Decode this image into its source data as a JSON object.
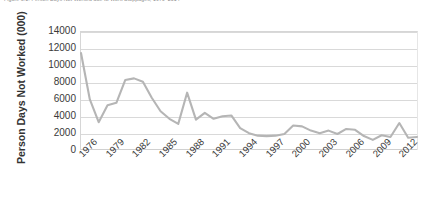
{
  "figure": {
    "caption": "Figure 3.1: Person Days Not Worked due to Work Stoppages, 1976–2014"
  },
  "chart_data": {
    "type": "line",
    "title": "",
    "subtitle": "",
    "xlabel": "",
    "ylabel": "Person Days Not Worked (000)",
    "grid": true,
    "legend": false,
    "legend_position": "none",
    "line_color": "#b5b5b5",
    "gridline_color": "#d9d9d9",
    "plot_background": "#ffffff",
    "ylim": [
      0,
      14000
    ],
    "yticks": [
      0,
      2000,
      4000,
      6000,
      8000,
      10000,
      12000,
      14000
    ],
    "ytick_labels": [
      "0",
      "2000",
      "4000",
      "6000",
      "8000",
      "10000",
      "12000",
      "14000"
    ],
    "xlim": [
      1976,
      2014
    ],
    "xticks": [
      1976,
      1979,
      1982,
      1985,
      1988,
      1991,
      1994,
      1997,
      2000,
      2003,
      2006,
      2009,
      2012
    ],
    "xtick_labels": [
      "1976",
      "1979",
      "1982",
      "1985",
      "1988",
      "1991",
      "1994",
      "1997",
      "2000",
      "2003",
      "2006",
      "2009",
      "2012"
    ],
    "xtick_rotation": -45,
    "x": [
      1976,
      1977,
      1978,
      1979,
      1980,
      1981,
      1982,
      1983,
      1984,
      1985,
      1986,
      1987,
      1988,
      1989,
      1990,
      1991,
      1992,
      1993,
      1994,
      1995,
      1996,
      1997,
      1998,
      1999,
      2000,
      2001,
      2002,
      2003,
      2004,
      2005,
      2006,
      2007,
      2008,
      2009,
      2010,
      2011,
      2012,
      2013,
      2014
    ],
    "series": [
      {
        "name": "Person Days Not Worked (000)",
        "color": "#b5b5b5",
        "values": [
          11500,
          6000,
          3300,
          5300,
          5600,
          8300,
          8500,
          8100,
          6200,
          4600,
          3700,
          3100,
          6800,
          3600,
          4400,
          3700,
          4000,
          4100,
          2600,
          2000,
          1700,
          1650,
          1700,
          1900,
          2900,
          2800,
          2300,
          2000,
          2300,
          1900,
          2500,
          2400,
          1650,
          1200,
          1750,
          1550,
          3200,
          1450,
          1550
        ]
      }
    ]
  }
}
